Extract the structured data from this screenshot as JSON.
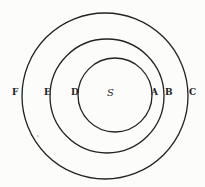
{
  "diagram": {
    "center_label": "S",
    "circles": [
      {
        "name": "inner",
        "cx": 105,
        "cy": 95,
        "r": 37
      },
      {
        "name": "middle",
        "cx": 105,
        "cy": 95,
        "r": 58
      },
      {
        "name": "outer",
        "cx": 105,
        "cy": 95,
        "r": 83
      }
    ],
    "labels": {
      "F": "F",
      "E": "E",
      "D": "D",
      "A": "A",
      "B": "B",
      "C": "C"
    },
    "stroke_color": "#222222"
  }
}
